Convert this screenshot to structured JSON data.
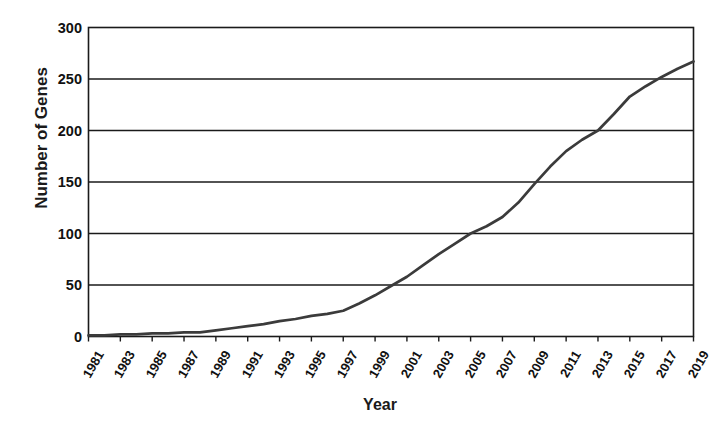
{
  "chart_data": {
    "type": "line",
    "title": "",
    "xlabel": "Year",
    "ylabel": "Number of Genes",
    "xlim": [
      1981,
      2019
    ],
    "ylim": [
      0,
      300
    ],
    "grid": true,
    "legend": "none",
    "x_tick_labels": [
      "1981",
      "1983",
      "1985",
      "1987",
      "1989",
      "1991",
      "1993",
      "1995",
      "1997",
      "1999",
      "2001",
      "2003",
      "2005",
      "2007",
      "2009",
      "2011",
      "2013",
      "2015",
      "2017",
      "2019"
    ],
    "y_tick_labels": [
      "0",
      "50",
      "100",
      "150",
      "200",
      "250",
      "300"
    ],
    "y_tick_values": [
      0,
      50,
      100,
      150,
      200,
      250,
      300
    ],
    "series": [
      {
        "name": "Number of Genes",
        "color": "#3b3b3b",
        "x": [
          1981,
          1982,
          1983,
          1984,
          1985,
          1986,
          1987,
          1988,
          1989,
          1990,
          1991,
          1992,
          1993,
          1994,
          1995,
          1996,
          1997,
          1998,
          1999,
          2000,
          2001,
          2002,
          2003,
          2004,
          2005,
          2006,
          2007,
          2008,
          2009,
          2010,
          2011,
          2012,
          2013,
          2014,
          2015,
          2016,
          2017,
          2018,
          2019
        ],
        "values": [
          1,
          1,
          2,
          2,
          3,
          3,
          4,
          4,
          6,
          8,
          10,
          12,
          15,
          17,
          20,
          22,
          25,
          32,
          40,
          49,
          58,
          69,
          80,
          90,
          100,
          107,
          116,
          130,
          148,
          165,
          180,
          191,
          200,
          216,
          233,
          243,
          252,
          260,
          267
        ]
      }
    ]
  },
  "axis": {
    "y_axis_label": "Number of Genes",
    "x_axis_label": "Year"
  }
}
